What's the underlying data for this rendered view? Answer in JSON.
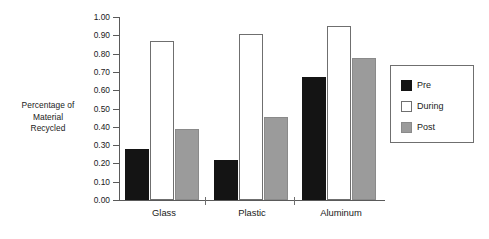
{
  "chart_data": {
    "type": "bar",
    "title": "",
    "xlabel": "",
    "ylabel": "Percentage of Material Recycled",
    "ylabel_lines": [
      "Percentage of",
      "Material",
      "Recycled"
    ],
    "categories": [
      "Glass",
      "Plastic",
      "Aluminum"
    ],
    "series": [
      {
        "name": "Pre",
        "color": "#141414",
        "values": [
          0.28,
          0.22,
          0.67
        ]
      },
      {
        "name": "During",
        "color": "#ffffff",
        "values": [
          0.87,
          0.905,
          0.95
        ]
      },
      {
        "name": "Post",
        "color": "#9b9b9b",
        "values": [
          0.39,
          0.455,
          0.775
        ]
      }
    ],
    "ylim": [
      0.0,
      1.0
    ],
    "ytick_step": 0.1,
    "ytick_labels": [
      "1.00",
      "0.90",
      "0.80",
      "0.70",
      "0.60",
      "0.50",
      "0.40",
      "0.30",
      "0.20",
      "0.10",
      "0.00"
    ],
    "ytick_values": [
      1.0,
      0.9,
      0.8,
      0.7,
      0.6,
      0.5,
      0.4,
      0.3,
      0.2,
      0.1,
      0.0
    ],
    "grid": false,
    "legend_position": "right",
    "legend_entries": [
      "Pre",
      "During",
      "Post"
    ]
  },
  "axis": {
    "y_title_line1": "Percentage of",
    "y_title_line2": "Material",
    "y_title_line3": "Recycled"
  },
  "legend": {
    "items": [
      {
        "label": "Pre",
        "swatch": "pre"
      },
      {
        "label": "During",
        "swatch": "during"
      },
      {
        "label": "Post",
        "swatch": "post"
      }
    ]
  },
  "colors": {
    "pre": "#141414",
    "during": "#ffffff",
    "post": "#9b9b9b",
    "axis": "#5a5a5a",
    "text": "#1a1a1a",
    "background": "#ffffff"
  }
}
